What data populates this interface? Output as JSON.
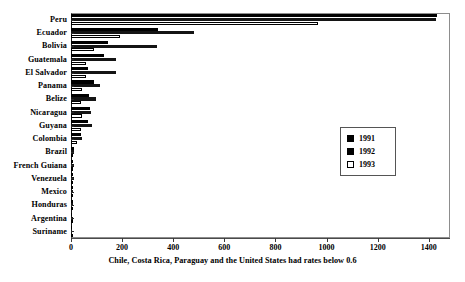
{
  "chart_data": {
    "type": "bar",
    "orientation": "horizontal",
    "title": "",
    "xlabel": "",
    "ylabel": "",
    "xlim": [
      0,
      1483
    ],
    "grid": false,
    "legend_position": "middle-right",
    "categories": [
      "Peru",
      "Ecuador",
      "Bolivia",
      "Guatemala",
      "El Salvador",
      "Panama",
      "Belize",
      "Nicaragua",
      "Guyana",
      "Colombia",
      "Brazil",
      "French Guiana",
      "Venezuela",
      "Mexico",
      "Honduras",
      "Argentina",
      "Suriname"
    ],
    "series": [
      {
        "name": "1991",
        "color": "#000000",
        "values": [
          1432,
          340,
          145,
          130,
          68,
          90,
          72,
          74,
          68,
          40,
          10,
          9,
          8,
          8,
          6,
          5,
          4
        ]
      },
      {
        "name": "1992",
        "color": "#141414",
        "values": [
          1430,
          480,
          335,
          175,
          178,
          112,
          96,
          80,
          84,
          42,
          12,
          10,
          10,
          9,
          7,
          6,
          5
        ]
      },
      {
        "name": "1993",
        "color": "#ffffff",
        "values": [
          965,
          190,
          90,
          60,
          58,
          44,
          40,
          42,
          38,
          22,
          7,
          6,
          5,
          5,
          4,
          4,
          3
        ]
      }
    ],
    "xticks": [
      0,
      200,
      400,
      600,
      800,
      1000,
      1200,
      1400
    ],
    "xticklabels": [
      "0",
      "200",
      "400",
      "600",
      "800",
      "1000",
      "1200",
      "1400"
    ],
    "caption": "Chile, Costa Rica, Paraguay and the United States had rates below 0.6",
    "legend": [
      {
        "label": "1991",
        "swatch": "filled"
      },
      {
        "label": "1992",
        "swatch": "filled"
      },
      {
        "label": "1993",
        "swatch": "hollow"
      }
    ]
  }
}
